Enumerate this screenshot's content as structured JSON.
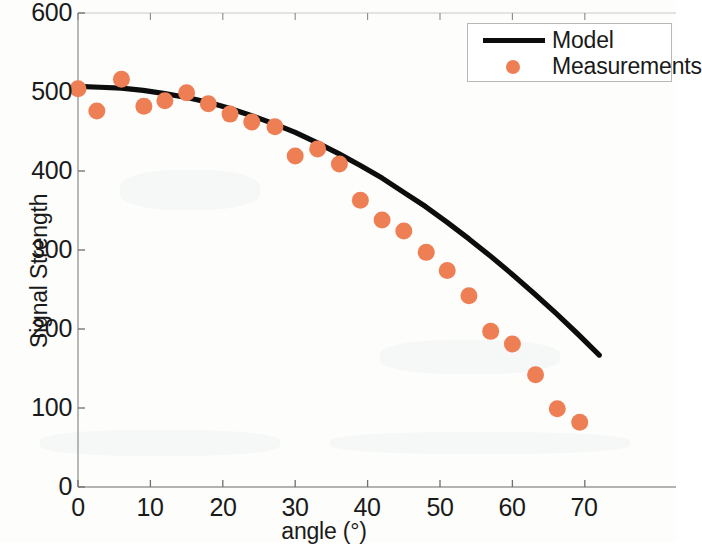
{
  "chart_data": {
    "type": "scatter",
    "title": "",
    "xlabel": "angle (°)",
    "ylabel": "Signal Strength",
    "xlim": [
      0,
      72
    ],
    "ylim": [
      0,
      600
    ],
    "xticks": [
      0,
      10,
      20,
      30,
      40,
      50,
      60,
      70
    ],
    "yticks": [
      0,
      100,
      200,
      300,
      400,
      500,
      600
    ],
    "grid": false,
    "legend_position": "top-right",
    "series": [
      {
        "name": "Model",
        "type": "line",
        "color": "#0d0d0d",
        "x": [
          0,
          3,
          6,
          9,
          12,
          15,
          18,
          21,
          24,
          27,
          30,
          33,
          36,
          39,
          42,
          45,
          48,
          51,
          54,
          57,
          60,
          63,
          66,
          69,
          72
        ],
        "values": [
          507,
          506,
          505,
          502,
          498,
          493,
          487,
          479,
          470,
          460,
          449,
          436,
          422,
          407,
          391,
          373,
          355,
          335,
          314,
          292,
          269,
          245,
          220,
          194,
          167
        ]
      },
      {
        "name": "Measurements",
        "type": "scatter",
        "color": "#ee7f54",
        "x": [
          0,
          2.6,
          6.0,
          9.1,
          12.0,
          15.0,
          18.0,
          21.0,
          24.0,
          27.2,
          30.0,
          33.1,
          36.1,
          39.0,
          42.0,
          45.0,
          48.1,
          51.0,
          54.0,
          57.0,
          60.0,
          63.2,
          66.2,
          69.3
        ],
        "values": [
          504,
          476,
          516,
          482,
          489,
          499,
          485,
          472,
          462,
          456,
          419,
          428,
          409,
          363,
          338,
          324,
          297,
          274,
          242,
          197,
          181,
          142,
          99,
          82
        ]
      }
    ]
  },
  "axes": {
    "y_tick_labels": [
      "600",
      "500",
      "400",
      "300",
      "200",
      "100",
      "0"
    ],
    "x_tick_labels": [
      "0",
      "10",
      "20",
      "30",
      "40",
      "50",
      "60",
      "70"
    ],
    "y_axis_title": "Signal Strength",
    "x_axis_title": "angle (°)"
  },
  "legend": {
    "entries": [
      {
        "label": "Model",
        "marker": "line",
        "color": "#0d0d0d"
      },
      {
        "label": "Measurements",
        "marker": "dot",
        "color": "#ee7f54"
      }
    ]
  }
}
